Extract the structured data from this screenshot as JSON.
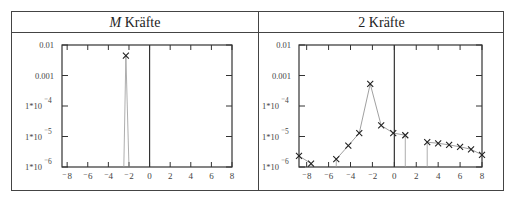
{
  "table": {
    "headers": [
      {
        "italic_prefix": "M",
        "label": " Kräfte"
      },
      {
        "italic_prefix": "",
        "label": "2 Kräfte"
      }
    ]
  },
  "chart_data": [
    {
      "type": "line",
      "title": "M Kräfte",
      "xlabel": "",
      "ylabel": "",
      "xlim": [
        -8.5,
        8
      ],
      "ylim": [
        1e-06,
        0.01
      ],
      "yscale": "log",
      "x_ticks": [
        "-8",
        "-6",
        "-4",
        "-2",
        "0",
        "2",
        "4",
        "6",
        "8"
      ],
      "y_ticks": [
        "0.01",
        "0.001",
        "1*10^-4",
        "1*10^-5",
        "1*10^-6"
      ],
      "grid": false,
      "series": [
        {
          "name": "M Kräfte",
          "marker": "x",
          "x": [
            -2.3
          ],
          "y": [
            0.0045
          ],
          "drop_lines": [
            -2.5,
            -2.0
          ]
        }
      ]
    },
    {
      "type": "line",
      "title": "2 Kräfte",
      "xlabel": "",
      "ylabel": "",
      "xlim": [
        -8.7,
        8
      ],
      "ylim": [
        1e-06,
        0.01
      ],
      "yscale": "log",
      "x_ticks": [
        "-8",
        "-6",
        "-4",
        "-2",
        "0",
        "2",
        "4",
        "6",
        "8"
      ],
      "y_ticks": [
        "0.01",
        "0.001",
        "1*10^-4",
        "1*10^-5",
        "1*10^-6"
      ],
      "grid": false,
      "series": [
        {
          "name": "2 Kräfte",
          "marker": "x",
          "x": [
            -8.7,
            -7.6,
            -5.3,
            -4.2,
            -3.2,
            -2.2,
            -1.2,
            -0.1,
            1.0,
            3.0,
            4.0,
            5.0,
            6.0,
            7.0,
            8.0
          ],
          "y": [
            2.3e-06,
            1.3e-06,
            1.8e-06,
            5e-06,
            1.3e-05,
            0.00053,
            2.3e-05,
            1.3e-05,
            1.1e-05,
            6.5e-06,
            6e-06,
            5.3e-06,
            4.6e-06,
            3.8e-06,
            2.5e-06
          ],
          "segments": [
            [
              0,
              1
            ],
            [
              2,
              3,
              4,
              5,
              6,
              7,
              8
            ],
            [
              9,
              10,
              11,
              12,
              13,
              14
            ]
          ]
        }
      ]
    }
  ]
}
